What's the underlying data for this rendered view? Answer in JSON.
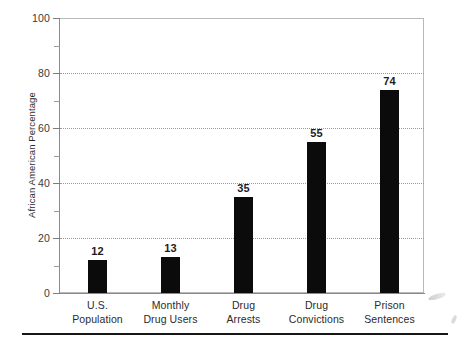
{
  "chart_data": {
    "type": "bar",
    "title": "",
    "xlabel": "",
    "ylabel": "African American Percentage",
    "ylim": [
      0,
      100
    ],
    "grid": "horizontal dotted gridlines at 20, 40, 60, 80",
    "legend": "none",
    "orientation": "vertical",
    "bar_color": "#0b0b0b",
    "categories": [
      "U.S. Population",
      "Monthly Drug Users",
      "Drug Arrests",
      "Drug Convictions",
      "Prison Sentences"
    ],
    "category_lines": [
      [
        "U.S.",
        "Population"
      ],
      [
        "Monthly",
        "Drug Users"
      ],
      [
        "Drug",
        "Arrests"
      ],
      [
        "Drug",
        "Convictions"
      ],
      [
        "Prison",
        "Sentences"
      ]
    ],
    "values": [
      12,
      13,
      35,
      55,
      74
    ],
    "value_labels": [
      "12",
      "13",
      "35",
      "55",
      "74"
    ],
    "y_ticks": [
      0,
      20,
      40,
      60,
      80,
      100
    ],
    "y_tick_labels": [
      "0",
      "20",
      "40",
      "60",
      "80",
      "100"
    ],
    "y_minor_ticks": [
      10,
      30,
      50,
      70,
      90
    ],
    "gridline_values": [
      20,
      40,
      60,
      80
    ]
  },
  "axis": {
    "y_title": "African American Percentage"
  },
  "colors": {
    "bar": "#0b0b0b",
    "frame": "#b9b9b9",
    "axis": "#8a8a8a",
    "grid": "#9a9a9a",
    "text": "#2b2b2b",
    "rule": "#161616",
    "background": "#ffffff"
  }
}
